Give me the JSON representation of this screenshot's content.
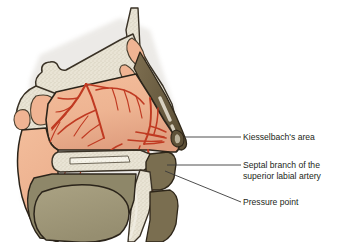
{
  "figure": {
    "background_color": "#ffffff"
  },
  "labels": [
    {
      "id": "kiesselbach",
      "text": "Kiesselbach's area",
      "line2": "",
      "leader_from": [
        243,
        137
      ],
      "leader_to": [
        185,
        137
      ]
    },
    {
      "id": "septal",
      "text": "Septal branch of the",
      "line2": "superior labial artery",
      "leader_from": [
        243,
        165
      ],
      "leader_to": [
        168,
        165
      ]
    },
    {
      "id": "pressure",
      "text": "Pressure point",
      "line2": "",
      "leader_from": [
        243,
        202
      ],
      "leader_to": [
        166,
        172
      ]
    }
  ],
  "colors": {
    "mucosa": "#efb693",
    "mucosa_shadow": "#e1a283",
    "bone": "#e9e4d5",
    "bone_outline": "#3a3226",
    "cartilage": "#6f6145",
    "artery": "#c03a22",
    "artery_dark": "#a62f1c",
    "tongue": "#a39b7c",
    "oral_dark": "#8e8769",
    "sinus_fill": "#f0b493",
    "text": "#231f20",
    "leader": "#3a3a3a",
    "background": "#ffffff"
  },
  "structures": [
    {
      "name": "frontal-sinus",
      "label": "Frontal sinus"
    },
    {
      "name": "sphenoid-sinus",
      "label": "Sphenoid sinus"
    },
    {
      "name": "nasal-septum-mucosa",
      "label": "Nasal septum mucosa"
    },
    {
      "name": "hard-palate",
      "label": "Hard palate"
    },
    {
      "name": "soft-palate",
      "label": "Soft palate"
    },
    {
      "name": "tongue",
      "label": "Tongue"
    },
    {
      "name": "upper-lip",
      "label": "Upper lip"
    },
    {
      "name": "nostril",
      "label": "Nostril"
    },
    {
      "name": "nasal-dorsum-cartilage",
      "label": "Nasal dorsum cartilage"
    },
    {
      "name": "anterior-ethmoidal-artery",
      "label": "Anterior ethmoidal artery"
    },
    {
      "name": "sphenopalatine-artery",
      "label": "Sphenopalatine artery"
    },
    {
      "name": "greater-palatine-artery",
      "label": "Greater palatine artery"
    }
  ]
}
